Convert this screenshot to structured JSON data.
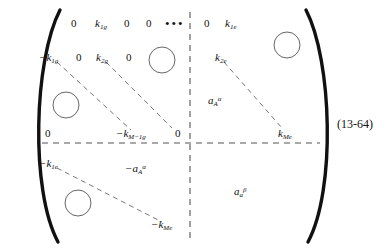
{
  "figure": {
    "kind": "matrix-equation",
    "equation_number": "(13-64)",
    "delimiters": {
      "left": "(",
      "right": ")"
    },
    "ink_color": "#111111",
    "dashed_color": "#555555",
    "circle_color": "#666666"
  },
  "matrix": {
    "block_rows": 2,
    "block_cols": 2,
    "entries": {
      "row1": {
        "c1": "0",
        "c2_base": "k",
        "c2_sub": "1g",
        "c3": "0",
        "c4": "0",
        "ellipsis": "•••",
        "c5": "0",
        "right_base": "k",
        "right_sub": "1e"
      },
      "row2": {
        "c1_base": "−k",
        "c1_sub": "1g",
        "c2": "0",
        "c3_base": "k",
        "c3_sub": "2g",
        "c4": "0",
        "right_base": "k",
        "right_sub": "2e"
      },
      "row3": {
        "c1": "0",
        "diag_base": "−k",
        "diag_sub": "M−1g",
        "c5": "0",
        "right_base": "k",
        "right_sub": "Me"
      },
      "row4": {
        "c1_base": "−k",
        "c1_sub": "1e",
        "diag_base": "−k",
        "diag_sub": "Me"
      }
    },
    "block_labels": {
      "top_right_base": "a",
      "top_right_sub": "A",
      "top_right_sup": "α",
      "bottom_left_base": "−a",
      "bottom_left_sub": "A",
      "bottom_left_sup": "α",
      "bottom_right_base": "a",
      "bottom_right_sub": "a",
      "bottom_right_sup": "β"
    }
  }
}
